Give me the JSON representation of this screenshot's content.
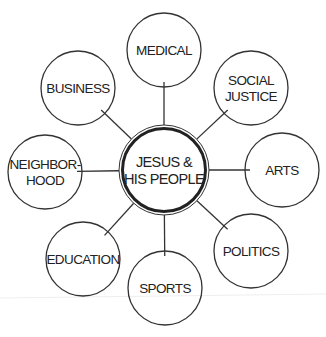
{
  "center": {
    "lines": [
      "JESUS &",
      "HIS PEOPLE"
    ],
    "cx": 164,
    "cy": 170,
    "r": 43
  },
  "nodes": [
    {
      "id": "medical",
      "lines": [
        "MEDICAL"
      ],
      "cx": 164,
      "cy": 50
    },
    {
      "id": "social-justice",
      "lines": [
        "SOCIAL",
        "JUSTICE"
      ],
      "cx": 251,
      "cy": 88
    },
    {
      "id": "arts",
      "lines": [
        "ARTS"
      ],
      "cx": 282,
      "cy": 170
    },
    {
      "id": "politics",
      "lines": [
        "POLITICS"
      ],
      "cx": 251,
      "cy": 251
    },
    {
      "id": "sports",
      "lines": [
        "SPORTS"
      ],
      "cx": 165,
      "cy": 288
    },
    {
      "id": "education",
      "lines": [
        "EDUCATION"
      ],
      "cx": 83,
      "cy": 259
    },
    {
      "id": "neighborhood",
      "lines": [
        "NEIGHBOR-",
        "HOOD"
      ],
      "cx": 45,
      "cy": 172
    },
    {
      "id": "business",
      "lines": [
        "BUSINESS"
      ],
      "cx": 78,
      "cy": 88
    }
  ],
  "style": {
    "node_radius": 37,
    "stroke": "#333333",
    "background": "#ffffff"
  }
}
